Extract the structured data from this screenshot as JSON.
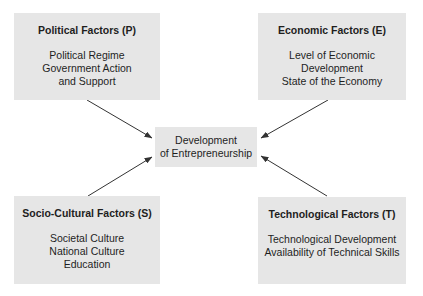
{
  "diagram": {
    "center": {
      "lines": [
        "Development",
        "of Entrepreneurship"
      ]
    },
    "factors": [
      {
        "id": "P",
        "title": "Political Factors (P)",
        "lines": [
          "Political Regime",
          "Government Action",
          "and Support"
        ],
        "position": "top-left"
      },
      {
        "id": "E",
        "title": "Economic Factors (E)",
        "lines": [
          "Level of Economic",
          "Development",
          "State of the Economy"
        ],
        "position": "top-right"
      },
      {
        "id": "S",
        "title": "Socio-Cultural Factors (S)",
        "lines": [
          "Societal Culture",
          "National Culture",
          "Education"
        ],
        "position": "bottom-left"
      },
      {
        "id": "T",
        "title": "Technological Factors (T)",
        "lines": [
          "Technological Development",
          "Availability of Technical Skills"
        ],
        "position": "bottom-right"
      }
    ],
    "colors": {
      "box_fill": "#e6e6e6",
      "text": "#1e1e1e",
      "arrow": "#333333",
      "background": "#ffffff"
    },
    "arrows": [
      {
        "from": "P",
        "to": "center"
      },
      {
        "from": "E",
        "to": "center"
      },
      {
        "from": "S",
        "to": "center"
      },
      {
        "from": "T",
        "to": "center"
      }
    ]
  }
}
